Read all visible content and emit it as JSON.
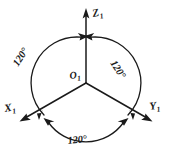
{
  "figure": {
    "background_color": "#ffffff",
    "ink_color": "#1a1a1a",
    "origin": {
      "label": "O",
      "subscript": "1",
      "name": "origin-label"
    },
    "axes": [
      {
        "id": "z1",
        "label": "Z",
        "subscript": "1",
        "direction_deg": 90,
        "arrow": "outward"
      },
      {
        "id": "x1",
        "label": "X",
        "subscript": "1",
        "direction_deg": 210,
        "arrow": "outward"
      },
      {
        "id": "y1",
        "label": "Y",
        "subscript": "1",
        "direction_deg": 330,
        "arrow": "outward"
      }
    ],
    "angles": [
      {
        "id": "angle-z-x",
        "value": "120",
        "unit": "°",
        "text": "120°",
        "between": "Z1-X1",
        "position": "upper-left"
      },
      {
        "id": "angle-z-y",
        "value": "120",
        "unit": "°",
        "text": "120°",
        "between": "Z1-Y1",
        "position": "upper-right"
      },
      {
        "id": "angle-x-y",
        "value": "120",
        "unit": "°",
        "text": "120°",
        "between": "X1-Y1",
        "position": "bottom"
      }
    ],
    "circle": {
      "center_x": 86,
      "center_y": 83,
      "radius": 46,
      "style": "three double-headed arc segments"
    }
  }
}
